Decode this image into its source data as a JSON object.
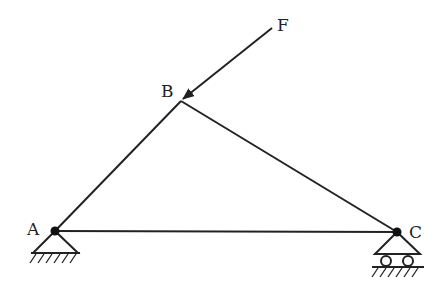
{
  "diagram": {
    "type": "truss",
    "labels": {
      "A": "A",
      "B": "B",
      "C": "C",
      "F": "F"
    },
    "nodes": {
      "A": {
        "x": 55,
        "y": 231
      },
      "B": {
        "x": 181,
        "y": 101
      },
      "C": {
        "x": 397,
        "y": 232
      }
    },
    "members": [
      {
        "from": "A",
        "to": "B"
      },
      {
        "from": "B",
        "to": "C"
      },
      {
        "from": "A",
        "to": "C"
      }
    ],
    "load": {
      "label": "F",
      "applied_at": "B",
      "from": {
        "x": 272,
        "y": 28
      }
    },
    "supports": {
      "A": "pinned",
      "C": "roller"
    },
    "colors": {
      "line": "#222222",
      "background": "#ffffff"
    }
  }
}
